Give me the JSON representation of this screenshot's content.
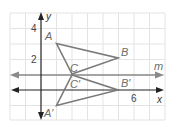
{
  "diagram": {
    "type": "coordinate-plane-reflection",
    "axes": {
      "x_label": "x",
      "y_label": "y",
      "x_tick_labels": [
        {
          "value": 6,
          "text": "6"
        }
      ],
      "y_tick_labels": [
        {
          "value": 2,
          "text": "2"
        },
        {
          "value": 4,
          "text": "4"
        }
      ]
    },
    "line_m": {
      "label": "m",
      "equation": "y = 1"
    },
    "triangle_original": {
      "vertices": [
        {
          "label": "A",
          "x": 1,
          "y": 3
        },
        {
          "label": "B",
          "x": 5,
          "y": 2
        },
        {
          "label": "C",
          "x": 2,
          "y": 1
        }
      ]
    },
    "triangle_image": {
      "vertices": [
        {
          "label": "A′",
          "x": 1,
          "y": -1
        },
        {
          "label": "B′",
          "x": 5,
          "y": 0
        },
        {
          "label": "C′",
          "x": 2,
          "y": 1
        }
      ]
    },
    "colors": {
      "grid": "#e3e3e3",
      "axes": "#222222",
      "line_m": "#8a8a8a",
      "triangles": "#7a7a7a",
      "labels": "#6d6d6d"
    }
  },
  "labels": {
    "A": "A",
    "B": "B",
    "C": "C",
    "A_prime": "A′",
    "B_prime": "B′",
    "C_prime": "C′",
    "m": "m",
    "x": "x",
    "y": "y",
    "tick_2": "2",
    "tick_4": "4",
    "tick_6": "6"
  }
}
